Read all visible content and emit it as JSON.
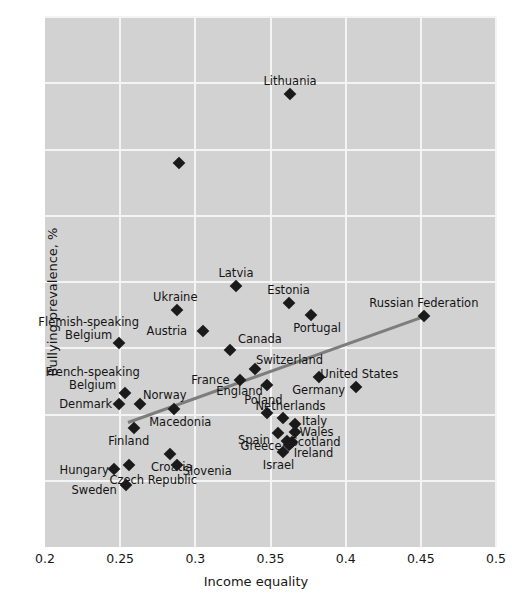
{
  "chart_data": {
    "type": "scatter",
    "title": "",
    "xlabel": "Income equality",
    "ylabel": "Bullying prevalence, %",
    "xlim": [
      0.2,
      0.5
    ],
    "ylim": [
      0,
      40
    ],
    "xticks": [
      "0.2",
      "0.25",
      "0.3",
      "0.35",
      "0.4",
      "0.45",
      "0.5"
    ],
    "xtick_values": [
      0.2,
      0.25,
      0.3,
      0.35,
      0.4,
      0.45,
      0.5
    ],
    "yticks": [
      "0",
      "5",
      "10",
      "15",
      "20",
      "25",
      "30",
      "35",
      "40"
    ],
    "ytick_values": [
      0,
      5,
      10,
      15,
      20,
      25,
      30,
      35,
      40
    ],
    "grid": true,
    "legend": "none",
    "background_color": "#d2d2d2",
    "gridline_color": "#f4f4f4",
    "marker_color": "#1a1a1a",
    "marker_shape": "diamond",
    "trendline_color": "#7d7d7d",
    "trendline": {
      "x0": 0.255,
      "y0": 9.4,
      "x1": 0.452,
      "y1": 17.4
    },
    "points": [
      {
        "name": "Lithuania",
        "x": 0.363,
        "y": 34.2,
        "label_dx": 0,
        "label_dy": -13,
        "label_align": "center"
      },
      {
        "name": "",
        "x": 0.289,
        "y": 29.0,
        "label_dx": 0,
        "label_dy": 0,
        "label_align": "center"
      },
      {
        "name": "Latvia",
        "x": 0.327,
        "y": 19.7,
        "label_dx": 0,
        "label_dy": -13,
        "label_align": "center"
      },
      {
        "name": "Estonia",
        "x": 0.362,
        "y": 18.4,
        "label_dx": 0,
        "label_dy": -13,
        "label_align": "center"
      },
      {
        "name": "Ukraine",
        "x": 0.288,
        "y": 17.9,
        "label_dx": -2,
        "label_dy": -13,
        "label_align": "center"
      },
      {
        "name": "Portugal",
        "x": 0.377,
        "y": 17.5,
        "label_dx": 6,
        "label_dy": 13,
        "label_align": "center"
      },
      {
        "name": "Russian Federation",
        "x": 0.452,
        "y": 17.4,
        "label_dx": 0,
        "label_dy": -13,
        "label_align": "center"
      },
      {
        "name": "Austria",
        "x": 0.305,
        "y": 16.3,
        "label_dx": -36,
        "label_dy": 0,
        "label_align": "right"
      },
      {
        "name": "Flemish-speaking\nBelgium",
        "x": 0.249,
        "y": 15.4,
        "label_dx": -30,
        "label_dy": -14,
        "label_align": "center"
      },
      {
        "name": "Canada",
        "x": 0.323,
        "y": 14.9,
        "label_dx": 30,
        "label_dy": -11,
        "label_align": "center"
      },
      {
        "name": "Switzerland",
        "x": 0.34,
        "y": 13.4,
        "label_dx": 34,
        "label_dy": -9,
        "label_align": "center"
      },
      {
        "name": "France",
        "x": 0.33,
        "y": 12.6,
        "label_dx": -30,
        "label_dy": 0,
        "label_align": "right"
      },
      {
        "name": "Germany",
        "x": 0.382,
        "y": 12.8,
        "label_dx": 0,
        "label_dy": 13,
        "label_align": "center"
      },
      {
        "name": "England",
        "x": 0.348,
        "y": 12.2,
        "label_dx": -28,
        "label_dy": 6,
        "label_align": "right"
      },
      {
        "name": "United States",
        "x": 0.407,
        "y": 12.1,
        "label_dx": 3,
        "label_dy": -13,
        "label_align": "center"
      },
      {
        "name": "French-speaking\nBelgium",
        "x": 0.253,
        "y": 11.6,
        "label_dx": -32,
        "label_dy": -14,
        "label_align": "center"
      },
      {
        "name": "Denmark",
        "x": 0.249,
        "y": 10.8,
        "label_dx": -33,
        "label_dy": 0,
        "label_align": "right"
      },
      {
        "name": "Norway",
        "x": 0.263,
        "y": 10.8,
        "label_dx": 25,
        "label_dy": -9,
        "label_align": "center"
      },
      {
        "name": "Macedonia",
        "x": 0.286,
        "y": 10.4,
        "label_dx": 6,
        "label_dy": 13,
        "label_align": "center"
      },
      {
        "name": "Poland",
        "x": 0.348,
        "y": 10.1,
        "label_dx": -4,
        "label_dy": -13,
        "label_align": "center"
      },
      {
        "name": "Netherlands",
        "x": 0.358,
        "y": 9.7,
        "label_dx": 8,
        "label_dy": -12,
        "label_align": "center"
      },
      {
        "name": "Italy",
        "x": 0.366,
        "y": 9.3,
        "label_dx": 20,
        "label_dy": -3,
        "label_align": "left"
      },
      {
        "name": "Wales",
        "x": 0.366,
        "y": 8.7,
        "label_dx": 22,
        "label_dy": 0,
        "label_align": "left"
      },
      {
        "name": "Spain",
        "x": 0.355,
        "y": 8.6,
        "label_dx": -24,
        "label_dy": 7,
        "label_align": "right"
      },
      {
        "name": "Finland",
        "x": 0.259,
        "y": 9.0,
        "label_dx": -5,
        "label_dy": 13,
        "label_align": "center"
      },
      {
        "name": "Greece",
        "x": 0.361,
        "y": 8.0,
        "label_dx": -26,
        "label_dy": 5,
        "label_align": "right"
      },
      {
        "name": "Scotland",
        "x": 0.364,
        "y": 7.9,
        "label_dx": 24,
        "label_dy": 0,
        "label_align": "left"
      },
      {
        "name": "Ireland",
        "x": 0.362,
        "y": 7.7,
        "label_dx": 25,
        "label_dy": 8,
        "label_align": "left"
      },
      {
        "name": "Israel",
        "x": 0.358,
        "y": 7.2,
        "label_dx": -4,
        "label_dy": 13,
        "label_align": "center"
      },
      {
        "name": "Croatia",
        "x": 0.283,
        "y": 7.0,
        "label_dx": 2,
        "label_dy": 13,
        "label_align": "center"
      },
      {
        "name": "Slovenia",
        "x": 0.288,
        "y": 6.2,
        "label_dx": 30,
        "label_dy": 6,
        "label_align": "center"
      },
      {
        "name": "Hungary",
        "x": 0.246,
        "y": 5.9,
        "label_dx": -30,
        "label_dy": 1,
        "label_align": "right"
      },
      {
        "name": "Czech Republic",
        "x": 0.256,
        "y": 6.2,
        "label_dx": 24,
        "label_dy": 15,
        "label_align": "center"
      },
      {
        "name": "Sweden",
        "x": 0.254,
        "y": 4.7,
        "label_dx": -32,
        "label_dy": 5,
        "label_align": "right"
      }
    ]
  }
}
